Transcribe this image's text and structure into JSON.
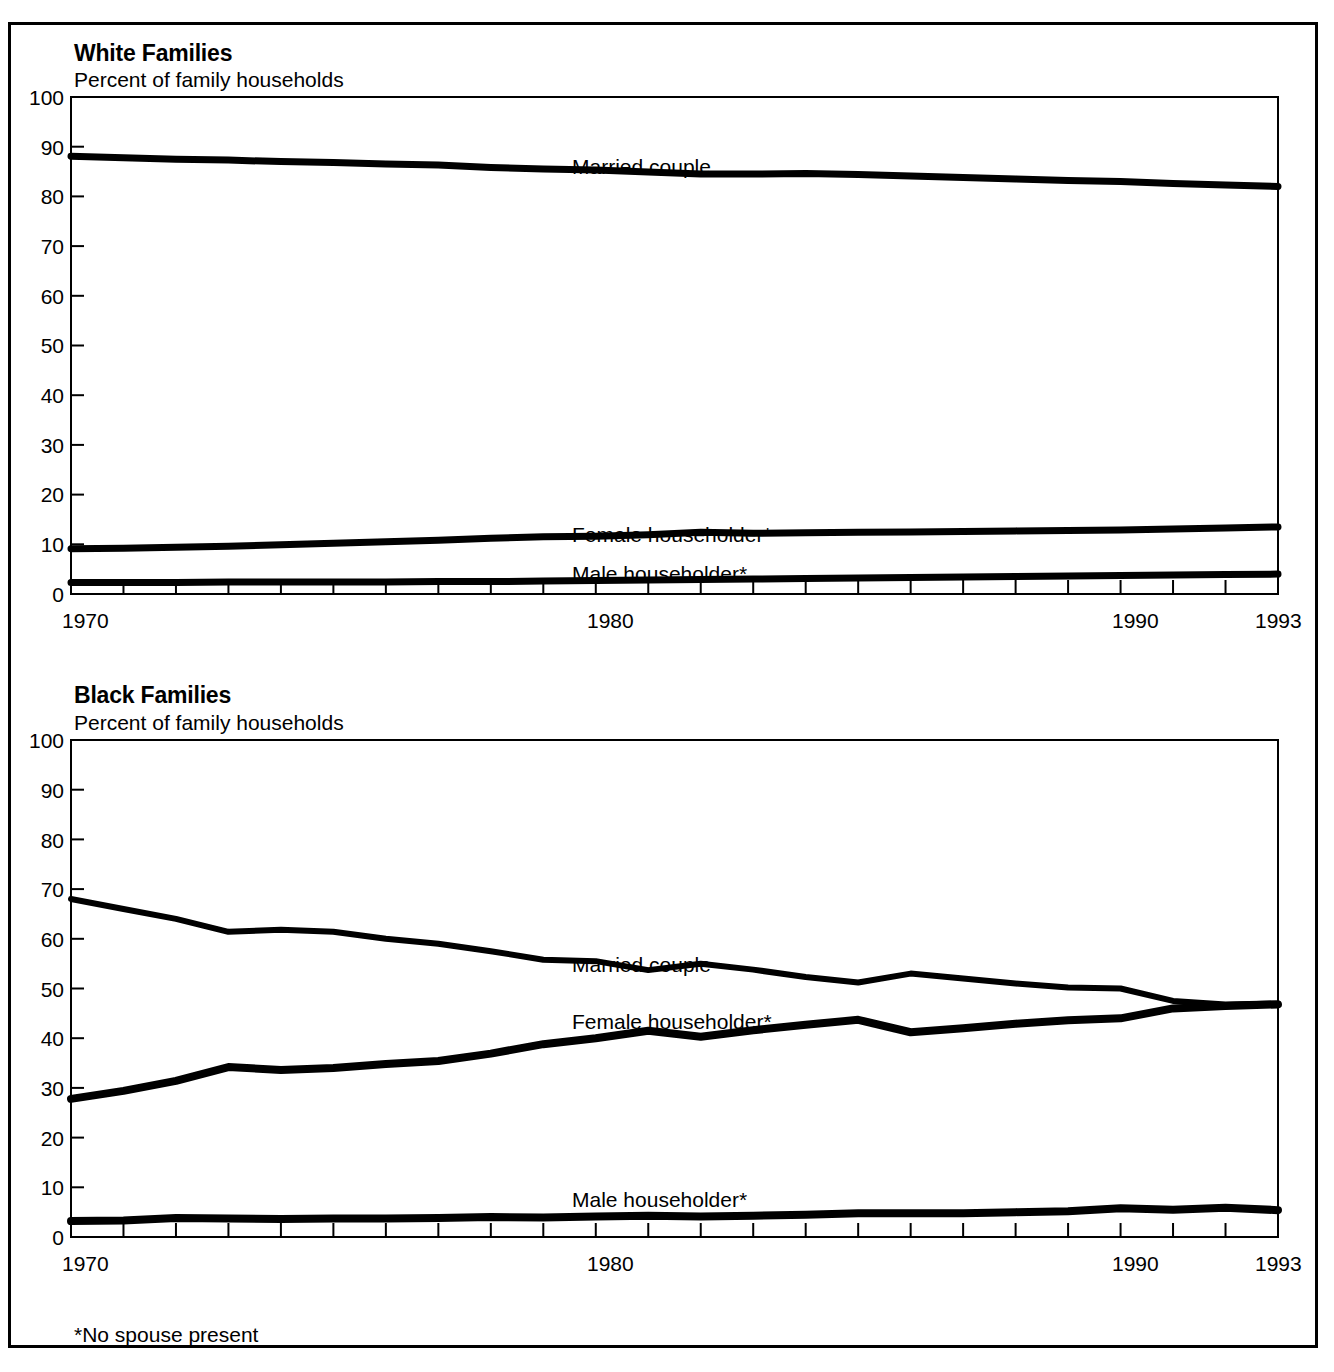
{
  "figure": {
    "footnote": "*No spouse present"
  },
  "panels": [
    {
      "id": "white-families",
      "title": "White Families",
      "subtitle": "Percent of family households",
      "series_labels": {
        "married": "Married couple",
        "female": "Female householder*",
        "male": "Male householder*"
      }
    },
    {
      "id": "black-families",
      "title": "Black Families",
      "subtitle": "Percent of family households",
      "series_labels": {
        "married": "Married couple",
        "female": "Female householder*",
        "male": "Male householder*"
      }
    }
  ],
  "chart_data": [
    {
      "type": "line",
      "title": "White Families",
      "subtitle": "Percent of family households",
      "xlabel": "",
      "ylabel": "Percent of family households",
      "xlim": [
        1970,
        1993
      ],
      "ylim": [
        0,
        100
      ],
      "ytick_labels": [
        "0",
        "10",
        "20",
        "30",
        "40",
        "50",
        "60",
        "70",
        "80",
        "90",
        "100"
      ],
      "yticks": [
        0,
        10,
        20,
        30,
        40,
        50,
        60,
        70,
        80,
        90,
        100
      ],
      "xtick_labels": [
        "1970",
        "1980",
        "1990",
        "1993"
      ],
      "xticks_labeled": [
        1970,
        1980,
        1990,
        1993
      ],
      "xticks_minor": [
        1971,
        1972,
        1973,
        1974,
        1975,
        1976,
        1977,
        1978,
        1979,
        1981,
        1982,
        1983,
        1984,
        1985,
        1986,
        1987,
        1988,
        1989,
        1991,
        1992
      ],
      "grid": false,
      "legend_position": "inline-annotations",
      "x": [
        1970,
        1971,
        1972,
        1973,
        1974,
        1975,
        1976,
        1977,
        1978,
        1979,
        1980,
        1981,
        1982,
        1983,
        1984,
        1985,
        1986,
        1987,
        1988,
        1989,
        1990,
        1991,
        1992,
        1993
      ],
      "series": [
        {
          "name": "Married couple",
          "values": [
            88.1,
            87.8,
            87.5,
            87.3,
            87.0,
            86.8,
            86.5,
            86.3,
            85.8,
            85.5,
            85.3,
            84.9,
            84.5,
            84.5,
            84.6,
            84.4,
            84.1,
            83.8,
            83.5,
            83.2,
            83.0,
            82.6,
            82.3,
            82.0
          ]
        },
        {
          "name": "Female householder*",
          "values": [
            9.1,
            9.2,
            9.4,
            9.6,
            9.9,
            10.2,
            10.5,
            10.8,
            11.2,
            11.5,
            11.6,
            11.9,
            12.4,
            12.2,
            12.3,
            12.4,
            12.5,
            12.6,
            12.7,
            12.8,
            12.9,
            13.1,
            13.3,
            13.5
          ]
        },
        {
          "name": "Male householder*",
          "values": [
            2.3,
            2.3,
            2.3,
            2.4,
            2.4,
            2.4,
            2.4,
            2.5,
            2.5,
            2.6,
            2.7,
            2.8,
            2.9,
            3.0,
            3.1,
            3.2,
            3.3,
            3.4,
            3.5,
            3.6,
            3.7,
            3.8,
            3.9,
            4.0
          ]
        }
      ]
    },
    {
      "type": "line",
      "title": "Black Families",
      "subtitle": "Percent of family households",
      "xlabel": "",
      "ylabel": "Percent of family households",
      "xlim": [
        1970,
        1993
      ],
      "ylim": [
        0,
        100
      ],
      "ytick_labels": [
        "0",
        "10",
        "20",
        "30",
        "40",
        "50",
        "60",
        "70",
        "80",
        "90",
        "100"
      ],
      "yticks": [
        0,
        10,
        20,
        30,
        40,
        50,
        60,
        70,
        80,
        90,
        100
      ],
      "xtick_labels": [
        "1970",
        "1980",
        "1990",
        "1993"
      ],
      "xticks_labeled": [
        1970,
        1980,
        1990,
        1993
      ],
      "xticks_minor": [
        1971,
        1972,
        1973,
        1974,
        1975,
        1976,
        1977,
        1978,
        1979,
        1981,
        1982,
        1983,
        1984,
        1985,
        1986,
        1987,
        1988,
        1989,
        1991,
        1992
      ],
      "grid": false,
      "legend_position": "inline-annotations",
      "x": [
        1970,
        1971,
        1972,
        1973,
        1974,
        1975,
        1976,
        1977,
        1978,
        1979,
        1980,
        1981,
        1982,
        1983,
        1984,
        1985,
        1986,
        1987,
        1988,
        1989,
        1990,
        1991,
        1992,
        1993
      ],
      "series": [
        {
          "name": "Married couple",
          "values": [
            68.0,
            66.0,
            64.0,
            61.4,
            61.8,
            61.4,
            60.0,
            59.0,
            57.5,
            55.8,
            55.5,
            53.7,
            55.0,
            53.8,
            52.3,
            51.2,
            53.0,
            52.0,
            51.0,
            50.2,
            50.0,
            47.5,
            46.8,
            47.0
          ]
        },
        {
          "name": "Female householder*",
          "values": [
            27.8,
            29.4,
            31.4,
            34.2,
            33.6,
            34.0,
            34.8,
            35.4,
            36.9,
            38.8,
            40.0,
            41.5,
            40.3,
            41.6,
            42.7,
            43.7,
            41.2,
            42.0,
            42.9,
            43.6,
            44.0,
            46.0,
            46.5,
            46.8
          ]
        },
        {
          "name": "Male householder*",
          "values": [
            3.2,
            3.3,
            3.8,
            3.7,
            3.6,
            3.7,
            3.7,
            3.8,
            4.0,
            3.9,
            4.1,
            4.3,
            4.1,
            4.3,
            4.5,
            4.8,
            4.8,
            4.8,
            5.0,
            5.2,
            5.8,
            5.5,
            5.9,
            5.4
          ]
        }
      ]
    }
  ]
}
